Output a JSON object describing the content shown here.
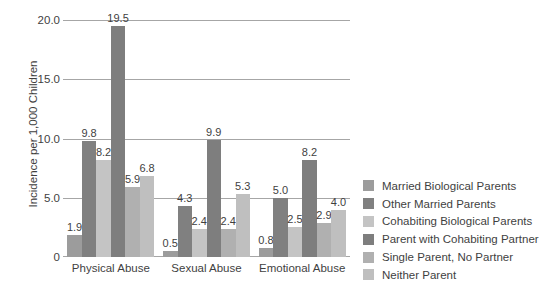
{
  "chart_data": {
    "type": "bar",
    "title": "",
    "subtitle": "",
    "xlabel": "",
    "ylabel": "Incidence per 1,000 Children",
    "categories": [
      "Physical Abuse",
      "Sexual Abuse",
      "Emotional Abuse"
    ],
    "ylim": [
      0,
      20
    ],
    "yticks": [
      "0",
      "5.0",
      "10.0",
      "15.0",
      "20.0"
    ],
    "ytick_values": [
      0,
      5,
      10,
      15,
      20
    ],
    "grid": "horizontal",
    "legend_position": "right",
    "data_labels": true,
    "series": [
      {
        "name": "Married Biological Parents",
        "color": "#9c9c9c",
        "values": [
          1.9,
          0.5,
          0.8
        ],
        "labels": [
          "1.9",
          "0.5",
          "0.8"
        ]
      },
      {
        "name": "Other Married Parents",
        "color": "#808080",
        "values": [
          9.8,
          4.3,
          5.0
        ],
        "labels": [
          "9.8",
          "4.3",
          "5.0"
        ]
      },
      {
        "name": "Cohabiting Biological Parents",
        "color": "#c4c4c4",
        "values": [
          8.2,
          2.4,
          2.5
        ],
        "labels": [
          "8.2",
          "2.4",
          "2.5"
        ]
      },
      {
        "name": "Parent with Cohabiting Partner",
        "color": "#7e7e7e",
        "values": [
          19.5,
          9.9,
          8.2
        ],
        "labels": [
          "19.5",
          "9.9",
          "8.2"
        ]
      },
      {
        "name": "Single Parent, No Partner",
        "color": "#b0b0b0",
        "values": [
          5.9,
          2.4,
          2.9
        ],
        "labels": [
          "5.9",
          "2.4",
          "2.9"
        ]
      },
      {
        "name": "Neither Parent",
        "color": "#bfbfbf",
        "values": [
          6.8,
          5.3,
          4.0
        ],
        "labels": [
          "6.8",
          "5.3",
          "4.0"
        ]
      }
    ]
  }
}
